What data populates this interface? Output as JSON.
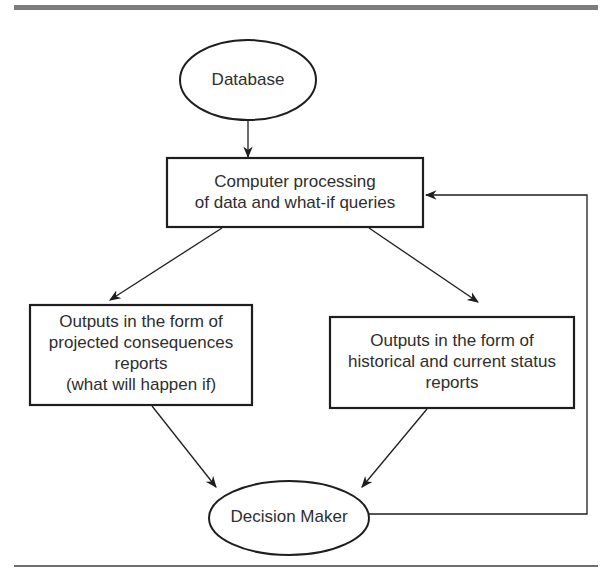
{
  "diagram": {
    "type": "flowchart",
    "nodes": [
      {
        "id": "database",
        "shape": "ellipse",
        "label": "Database"
      },
      {
        "id": "processing",
        "shape": "rectangle",
        "lines": [
          "Computer processing",
          "of data and what-if queries"
        ]
      },
      {
        "id": "projected",
        "shape": "rectangle",
        "lines": [
          "Outputs in the form of",
          "projected consequences",
          "reports",
          "(what will happen if)"
        ]
      },
      {
        "id": "historical",
        "shape": "rectangle",
        "lines": [
          "Outputs in the form of",
          "historical and current status",
          "reports"
        ]
      },
      {
        "id": "decision_maker",
        "shape": "ellipse",
        "label": "Decision Maker"
      }
    ],
    "edges": [
      {
        "from": "database",
        "to": "processing"
      },
      {
        "from": "processing",
        "to": "projected"
      },
      {
        "from": "processing",
        "to": "historical"
      },
      {
        "from": "projected",
        "to": "decision_maker"
      },
      {
        "from": "historical",
        "to": "decision_maker"
      },
      {
        "from": "decision_maker",
        "to": "processing",
        "style": "feedback-loop"
      }
    ]
  },
  "colors": {
    "stroke": "#1e1e1e",
    "text": "#2e2e2e",
    "rule": "#7c7c7c"
  }
}
